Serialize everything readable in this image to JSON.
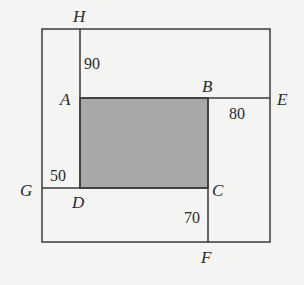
{
  "diagram": {
    "colors": {
      "background": "#f4f4f2",
      "line": "#3a3a3a",
      "shaded": "#a8a8a8"
    },
    "points": {
      "H": "H",
      "A": "A",
      "B": "B",
      "E": "E",
      "G": "G",
      "D": "D",
      "C": "C",
      "F": "F"
    },
    "lengths": {
      "HA": "90",
      "BE": "80",
      "GD": "50",
      "CF": "70"
    },
    "shaded_region": "ABCD"
  }
}
